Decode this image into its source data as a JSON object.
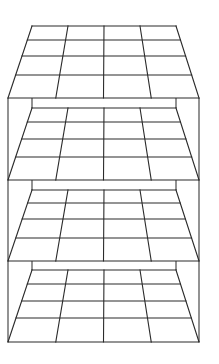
{
  "diagram": {
    "title": "",
    "line_color": "#2b2b2b",
    "background": "#ffffff",
    "frame": {
      "outer_left_x": 8,
      "outer_right_x": 199,
      "inner_left_x": 32,
      "inner_right_x": 176,
      "top_y": 98,
      "bottom_y": 342
    },
    "planes": [
      {
        "id": "plane-1",
        "rows": 4,
        "cols": 4,
        "top_y": 26,
        "bottom_y": 98,
        "top_left_x": 32,
        "top_right_x": 176,
        "bottom_left_x": 8,
        "bottom_right_x": 199,
        "h_lines_y": [
          26,
          40,
          56,
          75,
          98
        ]
      },
      {
        "id": "plane-2",
        "rows": 4,
        "cols": 4,
        "top_y": 108,
        "bottom_y": 180,
        "top_left_x": 32,
        "top_right_x": 176,
        "bottom_left_x": 8,
        "bottom_right_x": 199,
        "h_lines_y": [
          108,
          122,
          139,
          157,
          180
        ]
      },
      {
        "id": "plane-3",
        "rows": 4,
        "cols": 4,
        "top_y": 190,
        "bottom_y": 261,
        "top_left_x": 32,
        "top_right_x": 176,
        "bottom_left_x": 8,
        "bottom_right_x": 199,
        "h_lines_y": [
          190,
          203,
          219,
          238,
          261
        ]
      },
      {
        "id": "plane-4",
        "rows": 4,
        "cols": 4,
        "top_y": 270,
        "bottom_y": 342,
        "top_left_x": 32,
        "top_right_x": 176,
        "bottom_left_x": 8,
        "bottom_right_x": 199,
        "h_lines_y": [
          270,
          284,
          301,
          318,
          342
        ]
      }
    ]
  }
}
